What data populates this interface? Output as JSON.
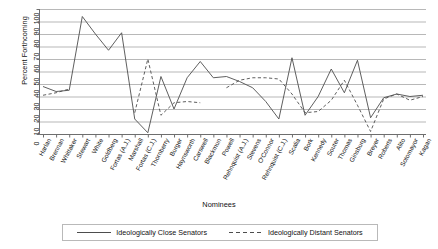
{
  "chart_data": {
    "type": "line",
    "title": "",
    "xlabel": "Nominees",
    "ylabel": "Percent Forthcoming",
    "ylim": [
      0,
      100
    ],
    "ytick_values": [
      0,
      10,
      20,
      30,
      40,
      50,
      60,
      70,
      80,
      90,
      100
    ],
    "ytick_labels": [
      "0",
      "10",
      "20",
      "30",
      "40",
      "50",
      "60",
      "70",
      "80",
      "90",
      "100"
    ],
    "grid": "horizontal",
    "legend_position": "bottom",
    "categories": [
      "Harlan",
      "Brennan",
      "Whittaker",
      "Stewart",
      "White",
      "Goldberg",
      "Fortas (A.J.)",
      "Marshall",
      "Fortas (C.J.)",
      "Thornberry",
      "Burger",
      "Haynsworth",
      "Carswell",
      "Blackmun",
      "Powell",
      "Rehnquist (A.J.)",
      "Stevens",
      "O'Connor",
      "Rehnquist (C.J.)",
      "Scalia",
      "Bork",
      "Kennedy",
      "Souter",
      "Thomas",
      "Ginsburg",
      "Breyer",
      "Roberts",
      "Alito",
      "Sotomayor",
      "Kagan"
    ],
    "series": [
      {
        "name": "Ideologically Close Senators",
        "style": "solid",
        "color": "#4d4d4d",
        "values": [
          38,
          34,
          35,
          94,
          80,
          67,
          81,
          12,
          1,
          46,
          20,
          45,
          58,
          45,
          46,
          42,
          37,
          26,
          12,
          61,
          15,
          30,
          52,
          33,
          59,
          13,
          29,
          32,
          30,
          31
        ]
      },
      {
        "name": "Ideologically Distant Senators",
        "style": "dashed",
        "color": "#4d4d4d",
        "values": [
          31,
          33,
          36,
          null,
          null,
          null,
          null,
          17,
          60,
          15,
          25,
          26,
          25,
          null,
          37,
          43,
          45,
          45,
          44,
          32,
          17,
          18,
          27,
          43,
          23,
          2,
          28,
          32,
          27,
          30
        ]
      }
    ]
  },
  "legend": {
    "entries": [
      {
        "label": "Ideologically Close Senators",
        "swatch": "solid-line-swatch"
      },
      {
        "label": "Ideologically Distant Senators",
        "swatch": "dashed-line-swatch"
      }
    ]
  }
}
